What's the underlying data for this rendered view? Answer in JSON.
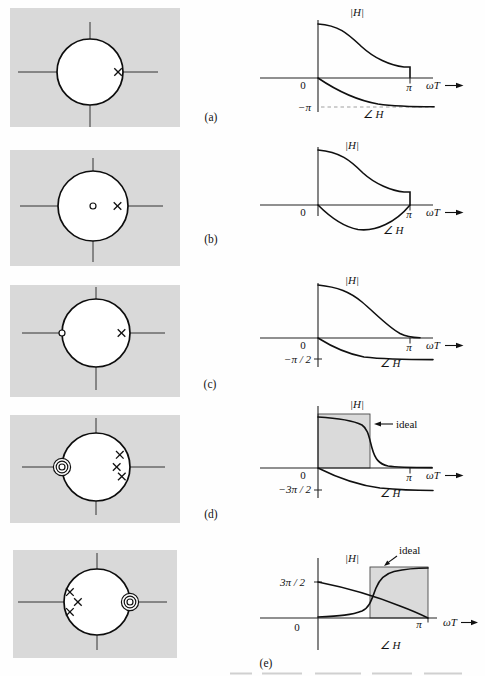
{
  "figure": {
    "colors": {
      "panel_bg": "#d9d9d9",
      "ideal_fill": "#dadada",
      "line": "#111111",
      "dashed_gray": "#a0a0a0"
    },
    "panels": [
      {
        "label": "(a)",
        "zplane": {
          "poles": [
            {
              "re": 0.85,
              "im": 0
            }
          ],
          "zeros": []
        },
        "labels": {
          "magnitude": "|H|",
          "phase": "∠ H",
          "origin": "0",
          "pi": "π",
          "axis": "ωT",
          "level": "−π"
        }
      },
      {
        "label": "(b)",
        "zplane": {
          "poles": [
            {
              "re": 0.7,
              "im": 0
            }
          ],
          "zeros": [
            {
              "re": 0,
              "im": 0,
              "rings": 1
            }
          ]
        },
        "labels": {
          "magnitude": "|H|",
          "phase": "∠ H",
          "origin": "0",
          "pi": "π",
          "axis": "ωT"
        }
      },
      {
        "label": "(c)",
        "zplane": {
          "poles": [
            {
              "re": 0.75,
              "im": 0
            }
          ],
          "zeros": [
            {
              "re": -1,
              "im": 0,
              "rings": 1
            }
          ]
        },
        "labels": {
          "magnitude": "|H|",
          "phase": "∠ H",
          "origin": "0",
          "pi": "π",
          "axis": "ωT",
          "level": "−π / 2"
        }
      },
      {
        "label": "(d)",
        "zplane": {
          "poles": [
            {
              "re": 0.7,
              "im": 0.36
            },
            {
              "re": 0.61,
              "im": 0
            },
            {
              "re": 0.76,
              "im": -0.28
            }
          ],
          "zeros": [
            {
              "re": -1,
              "im": 0,
              "rings": 3
            }
          ]
        },
        "labels": {
          "magnitude": "|H|",
          "phase": "∠ H",
          "origin": "0",
          "pi": "π",
          "axis": "ωT",
          "level": "−3π / 2",
          "ideal": "ideal"
        }
      },
      {
        "label": "(e)",
        "zplane": {
          "poles": [
            {
              "re": -0.82,
              "im": 0.3
            },
            {
              "re": -0.58,
              "im": 0
            },
            {
              "re": -0.82,
              "im": -0.3
            }
          ],
          "zeros": [
            {
              "re": 1,
              "im": 0,
              "rings": 3
            }
          ]
        },
        "labels": {
          "magnitude": "|H|",
          "phase": "∠ H",
          "origin": "0",
          "pi": "π",
          "axis": "ωT",
          "level": "3π / 2",
          "ideal": "ideal"
        }
      }
    ]
  }
}
